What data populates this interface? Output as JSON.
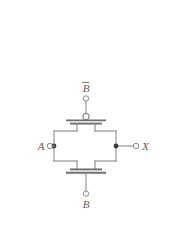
{
  "figure": {
    "kind": "circuit-schematic",
    "name": "CMOS transmission gate",
    "background_color": "#ffffff",
    "wire_color": "#8a8a8a",
    "label_color": "#5c5c5c",
    "junction_color": "#3a3a3a",
    "width_px": 170,
    "height_px": 227
  },
  "labels": {
    "control_complement": "B",
    "control_complement_has_overbar": true,
    "control_true": "B",
    "input": "A",
    "output": "X"
  },
  "terminals": [
    {
      "id": "control-top",
      "label": "B",
      "overbar": true,
      "x": 86,
      "y": 98,
      "style": "open-circle"
    },
    {
      "id": "input-left",
      "label": "A",
      "overbar": false,
      "x": 50,
      "y": 146,
      "style": "open-circle"
    },
    {
      "id": "output-right",
      "label": "X",
      "overbar": false,
      "x": 136,
      "y": 146,
      "style": "open-circle"
    },
    {
      "id": "control-bottom",
      "label": "B",
      "overbar": false,
      "x": 86,
      "y": 196,
      "style": "open-circle"
    }
  ],
  "devices": [
    {
      "id": "pmos",
      "type": "PMOS",
      "has_gate_bubble": true,
      "gate_net": "B-bar",
      "position": "top"
    },
    {
      "id": "nmos",
      "type": "NMOS",
      "has_gate_bubble": false,
      "gate_net": "B",
      "position": "bottom"
    }
  ],
  "junctions": [
    {
      "id": "junction-input",
      "x": 54,
      "y": 146
    },
    {
      "id": "junction-output",
      "x": 116,
      "y": 146
    }
  ]
}
